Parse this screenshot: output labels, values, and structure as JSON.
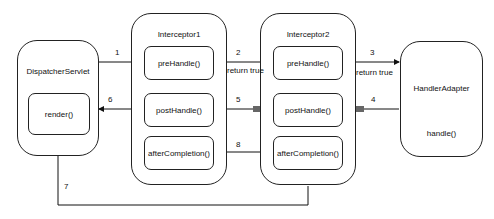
{
  "dispatcher": {
    "title": "DispatcherServlet",
    "render": "render()"
  },
  "interceptor1": {
    "title": "Interceptor1",
    "pre": "preHandle()",
    "post": "postHandle()",
    "after": "afterCompletion()"
  },
  "interceptor2": {
    "title": "Interceptor2",
    "pre": "preHandle()",
    "post": "postHandle()",
    "after": "afterCompletion()"
  },
  "adapter": {
    "title": "HandlerAdapter",
    "handle": "handle()"
  },
  "labels": {
    "step1": "1",
    "step2": "2",
    "step3": "3",
    "step4": "4",
    "step5": "5",
    "step6": "6",
    "step7": "7",
    "step8": "8",
    "return_true_1": "return true",
    "return_true_2": "return true"
  }
}
